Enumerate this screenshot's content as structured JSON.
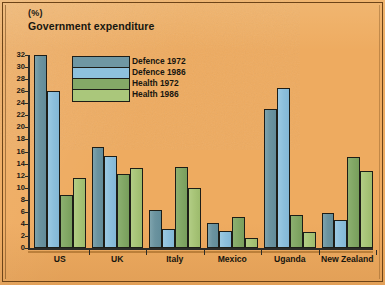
{
  "header": {
    "unit": "(%)",
    "title": "Government expenditure"
  },
  "legend": {
    "position": "inside-top-left",
    "items": [
      {
        "label": "Defence 1972",
        "color": "#6f97a3"
      },
      {
        "label": "Defence 1986",
        "color": "#8ec1dd"
      },
      {
        "label": "Health 1972",
        "color": "#84a967"
      },
      {
        "label": "Health 1986",
        "color": "#aac77b"
      }
    ]
  },
  "axis": {
    "y_ticks": [
      "0",
      "2",
      "4",
      "6",
      "8",
      "10",
      "12",
      "14",
      "16",
      "18",
      "20",
      "22",
      "24",
      "26",
      "28",
      "30",
      "32"
    ],
    "x_labels": [
      "US",
      "UK",
      "Italy",
      "Mexico",
      "Uganda",
      "New Zealand"
    ]
  },
  "colors": {
    "background": "#eeab60",
    "ink": "#1d1d17",
    "defence_1972": "#6f97a3",
    "defence_1986": "#8ec1dd",
    "health_1972": "#84a967",
    "health_1986": "#aac77b"
  },
  "chart_data": {
    "type": "bar",
    "title": "Government expenditure",
    "subtitle": "(%)",
    "xlabel": "",
    "ylabel": "(%)",
    "ylim": [
      0,
      32
    ],
    "ytick_step": 2,
    "grid": false,
    "legend_position": "upper left (inside plot)",
    "categories": [
      "US",
      "UK",
      "Italy",
      "Mexico",
      "Uganda",
      "New Zealand"
    ],
    "series": [
      {
        "name": "Defence 1972",
        "color": "#6f97a3",
        "values": [
          32.0,
          16.8,
          6.3,
          4.2,
          23.0,
          5.8
        ]
      },
      {
        "name": "Defence 1986",
        "color": "#8ec1dd",
        "values": [
          26.0,
          15.2,
          3.1,
          2.8,
          26.5,
          4.6
        ]
      },
      {
        "name": "Health 1972",
        "color": "#84a967",
        "values": [
          8.8,
          12.3,
          13.5,
          5.1,
          5.4,
          15.1
        ]
      },
      {
        "name": "Health 1986",
        "color": "#aac77b",
        "values": [
          11.6,
          13.2,
          9.9,
          1.6,
          2.6,
          12.7
        ]
      }
    ]
  }
}
